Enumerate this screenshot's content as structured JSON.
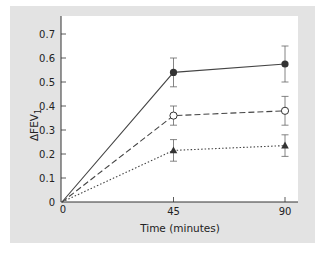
{
  "chart_data": {
    "type": "line",
    "title": "",
    "xlabel": "Time (minutes)",
    "ylabel": "ΔFEV",
    "ylabel_subscript": "1",
    "x": [
      0,
      45,
      90
    ],
    "x_tick_labels": [
      "0",
      "45",
      "90"
    ],
    "y_tick_labels": [
      "0",
      "0.1",
      "0.2",
      "0.3",
      "0.4",
      "0.5",
      "0.6",
      "0.7"
    ],
    "ylim": [
      0,
      0.75
    ],
    "xlim": [
      0,
      95
    ],
    "grid": false,
    "legend": null,
    "series": [
      {
        "name": "filled circles (solid line)",
        "marker": "filled-circle",
        "line": "solid",
        "values": [
          0,
          0.54,
          0.575
        ],
        "error_upper": [
          null,
          0.6,
          0.65
        ],
        "error_lower": [
          null,
          0.48,
          0.5
        ]
      },
      {
        "name": "open circles (dashed line)",
        "marker": "open-circle",
        "line": "dashed",
        "values": [
          0,
          0.36,
          0.38
        ],
        "error_upper": [
          null,
          0.4,
          0.44
        ],
        "error_lower": [
          null,
          0.32,
          0.32
        ]
      },
      {
        "name": "filled triangles (dotted line)",
        "marker": "filled-triangle",
        "line": "dotted",
        "values": [
          0,
          0.215,
          0.235
        ],
        "error_upper": [
          null,
          0.26,
          0.28
        ],
        "error_lower": [
          null,
          0.17,
          0.19
        ]
      }
    ]
  },
  "colors": {
    "panel_background": "#e3e3e3",
    "plot_background": "#ffffff",
    "line": "#444444"
  }
}
